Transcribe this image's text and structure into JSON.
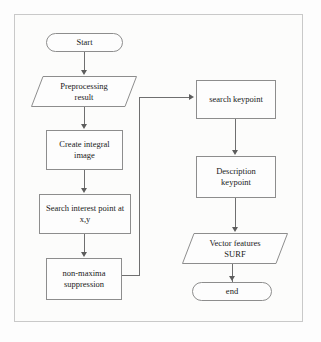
{
  "diagram": {
    "frame_color": "#c9c9c9",
    "node_border_color": "#8d8d8d",
    "connector_color": "#6f6f6f",
    "background": "#fcfcfb"
  },
  "nodes": {
    "start": {
      "label": "Start",
      "shape": "terminator"
    },
    "preprocessing": {
      "label": "Preprocessing\nresult",
      "line1": "Preprocessing",
      "line2": "result",
      "shape": "data"
    },
    "create_integral": {
      "line1": "Create integral",
      "line2": "image",
      "shape": "process"
    },
    "search_interest": {
      "line1": "Search interest point at",
      "line2": "x,y",
      "shape": "process"
    },
    "non_maxima": {
      "line1": "non-maxima",
      "line2": "suppression",
      "shape": "process"
    },
    "search_keypoint": {
      "label": "search keypoint",
      "shape": "process"
    },
    "description_keypoint": {
      "line1": "Description",
      "line2": "keypoint",
      "shape": "process"
    },
    "vector_features": {
      "line1": "Vector features",
      "line2": "SURF",
      "shape": "data"
    },
    "end": {
      "label": "end",
      "shape": "terminator"
    }
  }
}
